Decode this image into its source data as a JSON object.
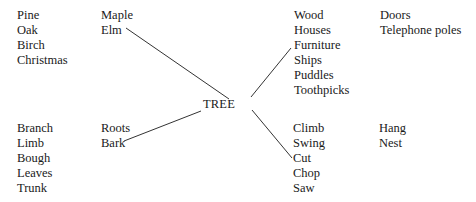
{
  "center": {
    "label": "TREE"
  },
  "groups": {
    "kinds_general": [
      "Pine",
      "Oak",
      "Birch",
      "Christmas"
    ],
    "kinds_linked": [
      "Maple",
      "Elm"
    ],
    "uses_linked": [
      "Wood",
      "Houses",
      "Furniture",
      "Ships",
      "Puddles",
      "Toothpicks"
    ],
    "uses_extra": [
      "Doors",
      "Telephone poles"
    ],
    "parts_general": [
      "Branch",
      "Limb",
      "Bough",
      "Leaves",
      "Trunk"
    ],
    "parts_linked": [
      "Roots",
      "Bark"
    ],
    "actions_linked": [
      "Climb",
      "Swing",
      "Cut",
      "Chop",
      "Saw"
    ],
    "actions_extra": [
      "Hang",
      "Nest"
    ]
  },
  "colors": {
    "text": "#1a1a1a",
    "line": "#333333",
    "background": "#ffffff"
  }
}
